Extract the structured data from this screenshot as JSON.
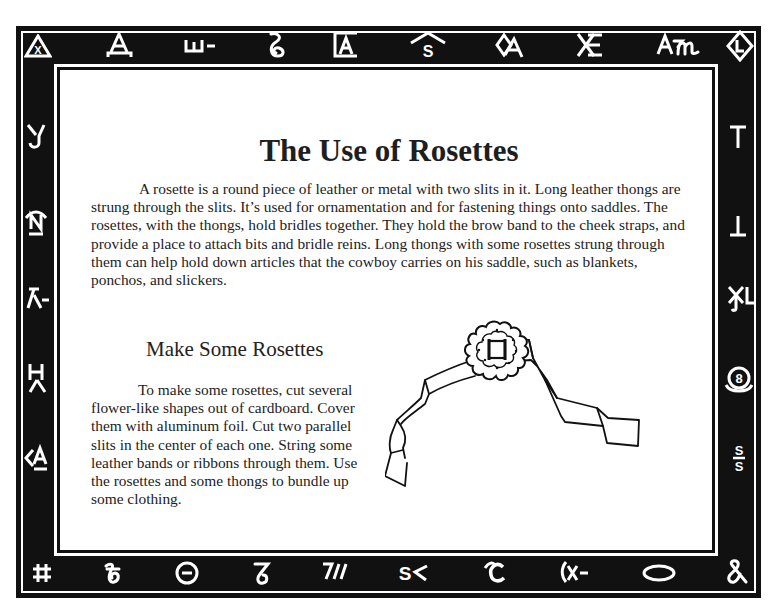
{
  "page": {
    "title": "The Use of Rosettes",
    "intro_paragraph": "A rosette is a round piece of leather or metal with two slits in it. Long leather thongs are strung through the slits. It’s used for ornamentation and for fastening things onto saddles. The rosettes, with the thongs, hold bridles together. They hold the brow band to the cheek straps, and provide a place to attach bits and bridle reins. Long thongs with some rosettes strung through them can help hold down articles that the cowboy carries on his saddle, such as blankets, ponchos, and slickers.",
    "activity": {
      "heading": "Make Some Rosettes",
      "instructions": "To make some rosettes, cut several flower-like shapes out of cardboard. Cover them with aluminum foil. Cut two parallel slits in the center of each one. String some leather bands or ribbons through them. Use the rosettes and some thongs to bundle up some clothing."
    },
    "illustration": {
      "subject": "rosette-on-ribbon-drawing"
    }
  },
  "border": {
    "colors": {
      "band": "#111111",
      "brand": "#ffffff"
    },
    "top_brands": [
      {
        "name": "x-in-triangle",
        "text": "X"
      },
      {
        "name": "a-bar",
        "text": "A"
      },
      {
        "name": "w-bar",
        "text": "ш-"
      },
      {
        "name": "lazy-s-curl",
        "text": ""
      },
      {
        "name": "a-box",
        "text": "A"
      },
      {
        "name": "s-rafter",
        "text": "S"
      },
      {
        "name": "a-diamond",
        "text": "A"
      },
      {
        "name": "x-e",
        "text": "XE"
      },
      {
        "name": "am",
        "text": "Aɱ"
      },
      {
        "name": "l-diamond",
        "text": "L"
      }
    ],
    "left_brands": [
      {
        "name": "j-y",
        "text": "Y"
      },
      {
        "name": "n-rafter-bar",
        "text": "N"
      },
      {
        "name": "lambda-bar",
        "text": "λ-"
      },
      {
        "name": "h-lambda",
        "text": "Hλ"
      },
      {
        "name": "less-a-bar",
        "text": "<A"
      }
    ],
    "right_brands": [
      {
        "name": "t",
        "text": "T"
      },
      {
        "name": "inverted-t",
        "text": "⊥"
      },
      {
        "name": "xl",
        "text": "XL"
      },
      {
        "name": "8-in-circle-rocker",
        "text": "8"
      },
      {
        "name": "s-bar-s",
        "text": "S/S"
      }
    ],
    "bottom_brands": [
      {
        "name": "hash",
        "text": "#"
      },
      {
        "name": "curly-b",
        "text": ""
      },
      {
        "name": "bar-in-circle",
        "text": "⊝"
      },
      {
        "name": "curly-7",
        "text": ""
      },
      {
        "name": "7-slash-slash",
        "text": "7//"
      },
      {
        "name": "s-less",
        "text": "S‹"
      },
      {
        "name": "rafter-c",
        "text": "C"
      },
      {
        "name": "paren-x-bar",
        "text": "(x-"
      },
      {
        "name": "oval",
        "text": ""
      },
      {
        "name": "pretzel-ampersand",
        "text": "&"
      }
    ]
  }
}
